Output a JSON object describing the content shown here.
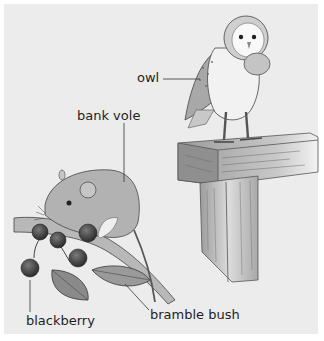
{
  "diagram": {
    "subjects": [
      "owl",
      "bank vole",
      "blackberry",
      "bramble bush"
    ],
    "labels": [
      {
        "id": "owl",
        "text": "owl"
      },
      {
        "id": "bank-vole",
        "text": "bank vole"
      },
      {
        "id": "blackberry",
        "text": "blackberry"
      },
      {
        "id": "bramble-bush",
        "text": "bramble bush"
      }
    ]
  },
  "colors": {
    "background": "#ececec",
    "margin": "#ffffff",
    "ink": "#1e1e1e",
    "berry": "#3a3a3a",
    "leaf": "#8a8a8a",
    "wood": "#b5b5b5"
  }
}
